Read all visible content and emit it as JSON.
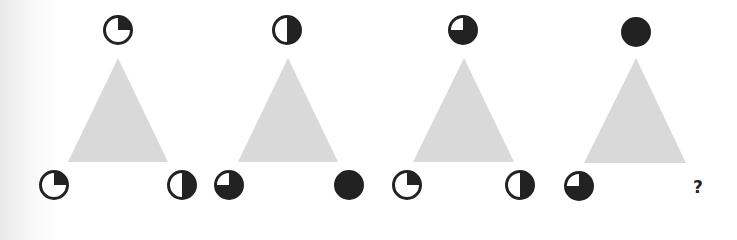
{
  "puzzle": {
    "colors": {
      "triangle": "#d9d9d9",
      "ink": "#222222",
      "paper": "#ffffff"
    },
    "panels": [
      {
        "triangle": {
          "apex": [
            118,
            58
          ],
          "left": [
            68,
            162
          ],
          "right": [
            168,
            162
          ]
        },
        "circles": [
          {
            "position": "top",
            "cx": 118,
            "cy": 30,
            "fill": "quarter"
          },
          {
            "position": "bottom-left",
            "cx": 54,
            "cy": 185,
            "fill": "quarter"
          },
          {
            "position": "bottom-right",
            "cx": 182,
            "cy": 185,
            "fill": "half"
          }
        ]
      },
      {
        "triangle": {
          "apex": [
            288,
            58
          ],
          "left": [
            238,
            162
          ],
          "right": [
            338,
            162
          ]
        },
        "circles": [
          {
            "position": "top",
            "cx": 287,
            "cy": 30,
            "fill": "half"
          },
          {
            "position": "bottom-left",
            "cx": 229,
            "cy": 185,
            "fill": "three-quarter"
          },
          {
            "position": "bottom-right",
            "cx": 349,
            "cy": 185,
            "fill": "full"
          }
        ]
      },
      {
        "triangle": {
          "apex": [
            464,
            58
          ],
          "left": [
            413,
            162
          ],
          "right": [
            514,
            162
          ]
        },
        "circles": [
          {
            "position": "top",
            "cx": 463,
            "cy": 30,
            "fill": "three-quarter"
          },
          {
            "position": "bottom-left",
            "cx": 407,
            "cy": 185,
            "fill": "quarter"
          },
          {
            "position": "bottom-right",
            "cx": 520,
            "cy": 185,
            "fill": "half"
          }
        ]
      },
      {
        "triangle": {
          "apex": [
            636,
            58
          ],
          "left": [
            584,
            163
          ],
          "right": [
            686,
            163
          ]
        },
        "circles": [
          {
            "position": "top",
            "cx": 636,
            "cy": 32,
            "fill": "full"
          },
          {
            "position": "bottom-left",
            "cx": 579,
            "cy": 186,
            "fill": "three-quarter"
          }
        ],
        "unknown": {
          "position": "bottom-right",
          "x": 698,
          "y": 193,
          "label": "?"
        }
      }
    ]
  }
}
